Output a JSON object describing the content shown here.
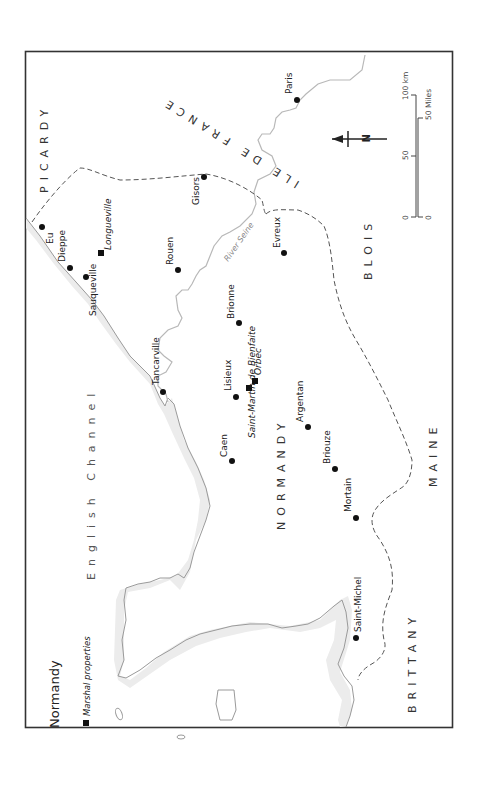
{
  "title": "Normandy",
  "legend": {
    "symbol": "square",
    "label": "Marshal properties"
  },
  "regions": {
    "picardy": "PICARDY",
    "ile_de_france": "ILE DE FRANCE",
    "normandy": "NORMANDY",
    "blois": "BLOIS",
    "maine": "MAINE",
    "brittany": "BRITTANY"
  },
  "sea": "English Channel",
  "river": "River Seine",
  "towns": [
    {
      "name": "Paris",
      "type": "town"
    },
    {
      "name": "Gisors",
      "type": "town"
    },
    {
      "name": "Eu",
      "type": "town"
    },
    {
      "name": "Dieppe",
      "type": "town"
    },
    {
      "name": "Longueville",
      "type": "property"
    },
    {
      "name": "Sauqueville",
      "type": "town"
    },
    {
      "name": "Rouen",
      "type": "town"
    },
    {
      "name": "Evreux",
      "type": "town"
    },
    {
      "name": "Brionne",
      "type": "town"
    },
    {
      "name": "Tancarville",
      "type": "town"
    },
    {
      "name": "Lisieux",
      "type": "town"
    },
    {
      "name": "Saint-Martin de Bienfaite",
      "type": "property"
    },
    {
      "name": "Orbec",
      "type": "property"
    },
    {
      "name": "Caen",
      "type": "town"
    },
    {
      "name": "Argentan",
      "type": "town"
    },
    {
      "name": "Briouze",
      "type": "town"
    },
    {
      "name": "Mortain",
      "type": "town"
    },
    {
      "name": "Saint-Michel",
      "type": "town"
    }
  ],
  "compass": {
    "label": "N"
  },
  "scale": {
    "km_labels": [
      "0",
      "50",
      "100 km"
    ],
    "mile_labels": [
      "0",
      "50 Miles"
    ]
  }
}
